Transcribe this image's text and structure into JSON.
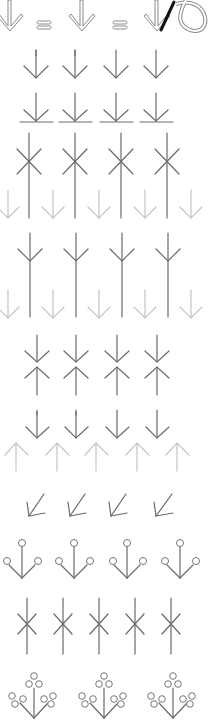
{
  "diagram": {
    "width": 208,
    "height": 720,
    "colors": {
      "dark_stroke": "#6a6a6a",
      "light_stroke": "#c4c4c4",
      "bold_stroke": "#111111",
      "background": "#ffffff"
    },
    "rows": [
      {
        "id": "row-1",
        "name": "double-outline-arrows-with-equals",
        "y": 18,
        "items": [
          "arrow",
          "equals",
          "arrow",
          "equals",
          "arrow-with-slash-curve"
        ]
      },
      {
        "id": "row-2",
        "name": "simple-down-arrows",
        "y": 64,
        "count": 4,
        "x": [
          36,
          75,
          116,
          156
        ]
      },
      {
        "id": "row-3",
        "name": "down-arrows-with-baseline",
        "y": 108,
        "count": 4,
        "x": [
          36,
          75,
          116,
          156
        ]
      },
      {
        "id": "row-4",
        "name": "tall-lines-with-x",
        "cross_y": 161,
        "count": 4,
        "x": [
          29,
          75,
          121,
          167
        ],
        "light_arrows_x": [
          8,
          53,
          99,
          145,
          191
        ]
      },
      {
        "id": "row-5",
        "name": "tall-lines-with-chevron",
        "chevron_y": 260,
        "count": 4,
        "x": [
          29,
          75,
          121,
          167
        ],
        "light_arrows_x": [
          8,
          53,
          99,
          145,
          191
        ]
      },
      {
        "id": "row-6",
        "name": "down-up-arrow-pairs",
        "y": 362,
        "count": 4,
        "x": [
          37,
          76,
          117,
          157
        ]
      },
      {
        "id": "row-7",
        "name": "down-arrows-over-light-up-arrows",
        "count_dark": 4,
        "dark_x": [
          37,
          76,
          117,
          157
        ],
        "light_x": [
          16,
          57,
          96,
          137,
          177
        ]
      },
      {
        "id": "row-8",
        "name": "diagonal-arrows",
        "y": 507,
        "count": 4,
        "x": [
          28,
          68,
          110,
          155
        ]
      },
      {
        "id": "row-9",
        "name": "three-circle-forks",
        "count": 4,
        "x": [
          21,
          74,
          126,
          180
        ]
      },
      {
        "id": "row-10",
        "name": "six-point-stars",
        "count": 5,
        "x": [
          27,
          63,
          99,
          135,
          171
        ]
      },
      {
        "id": "row-11",
        "name": "circle-clusters",
        "count": 3,
        "x": [
          34,
          104,
          173
        ]
      }
    ]
  }
}
